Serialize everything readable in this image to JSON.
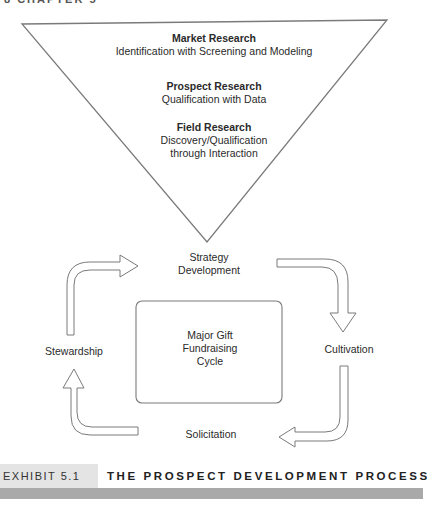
{
  "page_header": "8    CHAPTER 5",
  "funnel": {
    "levels": [
      {
        "title": "Market Research",
        "subtitle": "Identification with Screening and Modeling"
      },
      {
        "title": "Prospect Research",
        "subtitle": "Qualification with Data"
      },
      {
        "title": "Field Research",
        "subtitle_line1": "Discovery/Qualification",
        "subtitle_line2": "through Interaction"
      }
    ]
  },
  "cycle": {
    "top_label_line1": "Strategy",
    "top_label_line2": "Development",
    "right_label": "Cultivation",
    "bottom_label": "Solicitation",
    "left_label": "Stewardship",
    "center_line1": "Major Gift",
    "center_line2": "Fundraising",
    "center_line3": "Cycle"
  },
  "caption": {
    "tag": "EXHIBIT 5.1",
    "title": "THE PROSPECT DEVELOPMENT PROCESS"
  },
  "colors": {
    "line": "#7a7a7a",
    "caption_tag_bg": "#e4e4e4",
    "caption_bar": "#a9a9a9"
  }
}
